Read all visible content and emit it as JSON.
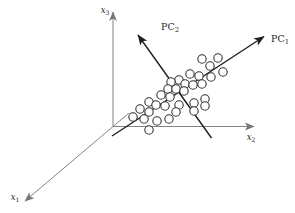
{
  "figure": {
    "background": "#ffffff",
    "axis_color": "#757575",
    "pc_color": "#1f1f1f",
    "point_stroke": "#333333",
    "point_fill": "#ffffff",
    "point_radius": 4.2,
    "axis_stroke_width": 0.9,
    "pc_stroke_width": 1.4,
    "point_stroke_width": 1.1,
    "axes": [
      {
        "name": "x3-axis",
        "kind": "axis",
        "x1": 113,
        "y1": 126.5,
        "x2": 113,
        "y2": 12
      },
      {
        "name": "x2-axis",
        "kind": "axis",
        "x1": 113,
        "y1": 126.5,
        "x2": 254,
        "y2": 126.5
      },
      {
        "name": "x1-axis",
        "kind": "axis",
        "x1": 129,
        "y1": 113,
        "x2": 25,
        "y2": 201
      },
      {
        "name": "pc1-axis",
        "kind": "pc",
        "x1": 112,
        "y1": 136,
        "x2": 264,
        "y2": 36.5
      },
      {
        "name": "pc2-axis",
        "kind": "pc",
        "x1": 211.5,
        "y1": 138,
        "x2": 138,
        "y2": 35
      }
    ],
    "labels": [
      {
        "name": "x3-label",
        "base": "x",
        "sub": "3",
        "x": 105,
        "y": 13,
        "style": "var",
        "size": 8.5
      },
      {
        "name": "x2-label",
        "base": "x",
        "sub": "2",
        "x": 251,
        "y": 140,
        "style": "var",
        "size": 8.5
      },
      {
        "name": "x1-label",
        "base": "x",
        "sub": "1",
        "x": 15,
        "y": 200,
        "style": "var",
        "size": 8.5
      },
      {
        "name": "pc2-label",
        "base": "PC",
        "sub": "2",
        "x": 170,
        "y": 30,
        "style": "roman",
        "size": 9.5
      },
      {
        "name": "pc1-label",
        "base": "PC",
        "sub": "1",
        "x": 280,
        "y": 42,
        "style": "roman",
        "size": 9.5
      }
    ],
    "points": [
      {
        "x": 202,
        "y": 59
      },
      {
        "x": 218,
        "y": 58
      },
      {
        "x": 210,
        "y": 66
      },
      {
        "x": 223,
        "y": 72
      },
      {
        "x": 190,
        "y": 74
      },
      {
        "x": 199,
        "y": 76
      },
      {
        "x": 211,
        "y": 77
      },
      {
        "x": 179,
        "y": 80
      },
      {
        "x": 171,
        "y": 82
      },
      {
        "x": 185,
        "y": 84
      },
      {
        "x": 193,
        "y": 85
      },
      {
        "x": 202,
        "y": 84
      },
      {
        "x": 168,
        "y": 89
      },
      {
        "x": 176,
        "y": 89
      },
      {
        "x": 184,
        "y": 91
      },
      {
        "x": 161,
        "y": 95
      },
      {
        "x": 170,
        "y": 97
      },
      {
        "x": 205,
        "y": 99
      },
      {
        "x": 149,
        "y": 102
      },
      {
        "x": 194,
        "y": 103
      },
      {
        "x": 179,
        "y": 105
      },
      {
        "x": 156,
        "y": 105
      },
      {
        "x": 205,
        "y": 106
      },
      {
        "x": 165,
        "y": 106
      },
      {
        "x": 140,
        "y": 109
      },
      {
        "x": 194,
        "y": 111
      },
      {
        "x": 149,
        "y": 112
      },
      {
        "x": 176,
        "y": 112
      },
      {
        "x": 133,
        "y": 117
      },
      {
        "x": 144,
        "y": 119
      },
      {
        "x": 169,
        "y": 119
      },
      {
        "x": 157,
        "y": 121
      },
      {
        "x": 149,
        "y": 130
      }
    ]
  }
}
